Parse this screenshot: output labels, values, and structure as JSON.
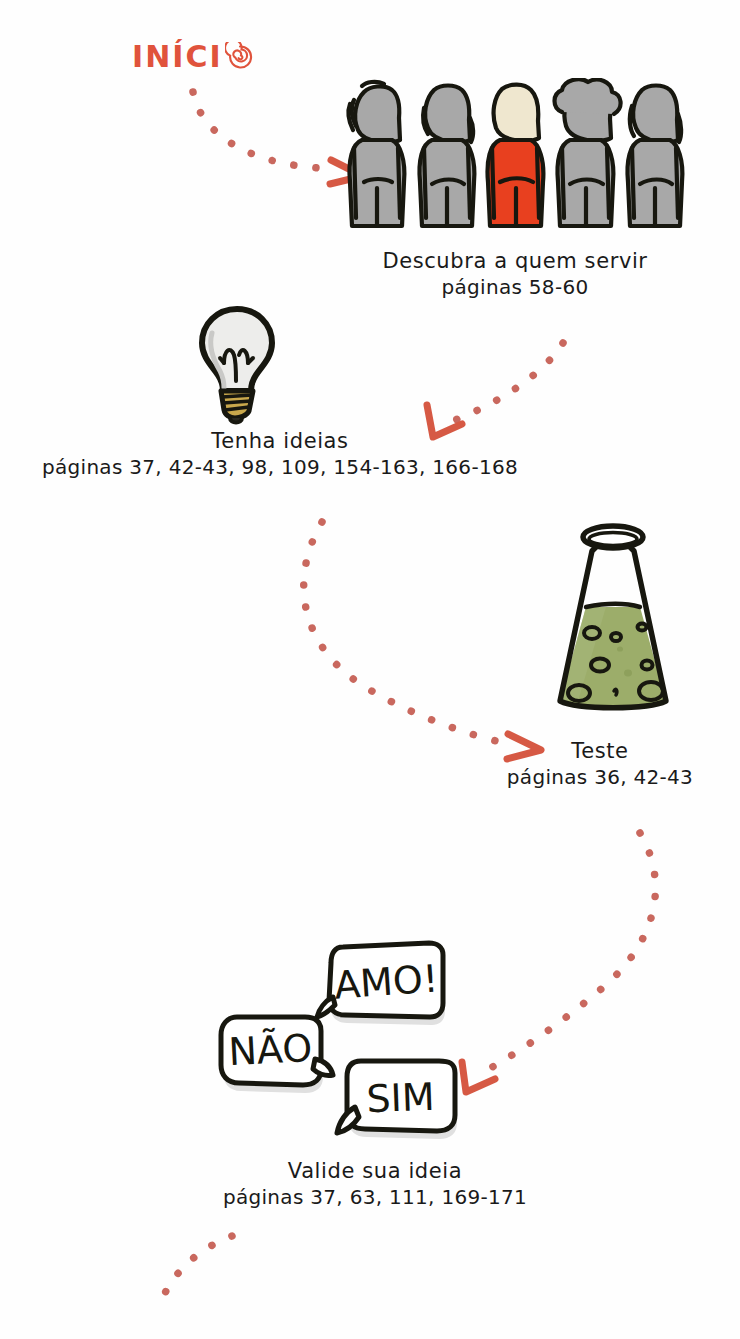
{
  "page": {
    "width": 740,
    "height": 1339,
    "background": "#fefefe",
    "kind": "hand-drawn-flowchart",
    "language": "pt-BR"
  },
  "palette": {
    "accent_red": "#E0533C",
    "dot_red": "#C9685E",
    "arrow_red": "#D65944",
    "ink_black": "#1a1a1a",
    "figure_gray": "#A8A8A8",
    "figure_gray_dark": "#8f8f8f",
    "figure_red": "#E8401F",
    "figure_face_cream": "#EFE7CF",
    "flask_green": "#9CAD6A",
    "flask_green_dark": "#7d8c4f",
    "bulb_glass": "#EDEDEB",
    "bulb_base": "#C9A84C",
    "bubble_white": "#ffffff",
    "bubble_shadow": "#d8d8d8"
  },
  "start": {
    "label": "INÍCIO",
    "label_text": "INÍCI",
    "spiral_glyph": "spiral-o",
    "color": "#E0533C"
  },
  "steps": [
    {
      "id": "descubra",
      "icon": "five-people-icon",
      "title": "Descubra a quem servir",
      "pages": "páginas 58-60",
      "highlight_index": 2,
      "figure_count": 5
    },
    {
      "id": "tenha-ideias",
      "icon": "lightbulb-icon",
      "title": "Tenha ideias",
      "pages": "páginas 37, 42-43, 98, 109, 154-163, 166-168"
    },
    {
      "id": "teste",
      "icon": "erlenmeyer-flask-icon",
      "title": "Teste",
      "pages": "páginas 36, 42-43"
    },
    {
      "id": "valide",
      "icon": "speech-bubbles-icon",
      "title": "Valide sua ideia",
      "pages": "páginas 37, 63, 111, 169-171",
      "bubbles": [
        {
          "id": "amo",
          "text": "AMO!"
        },
        {
          "id": "nao",
          "text": "NÃO"
        },
        {
          "id": "sim",
          "text": "SIM"
        }
      ]
    }
  ],
  "connectors": [
    {
      "id": "inicio-to-descubra",
      "from": "INÍCIO",
      "to": "Descubra a quem servir",
      "style": "dotted-curve",
      "arrow": "right"
    },
    {
      "id": "descubra-to-ideias",
      "from": "Descubra a quem servir",
      "to": "Tenha ideias",
      "style": "dotted-curve",
      "arrow": "down-left"
    },
    {
      "id": "ideias-to-teste",
      "from": "Tenha ideias",
      "to": "Teste",
      "style": "dotted-curve",
      "arrow": "right"
    },
    {
      "id": "teste-to-valide",
      "from": "Teste",
      "to": "Valide sua ideia",
      "style": "dotted-curve",
      "arrow": "down-left"
    },
    {
      "id": "valide-to-next",
      "from": "Valide sua ideia",
      "to": "continua",
      "style": "dotted-curve",
      "arrow": "none"
    }
  ]
}
